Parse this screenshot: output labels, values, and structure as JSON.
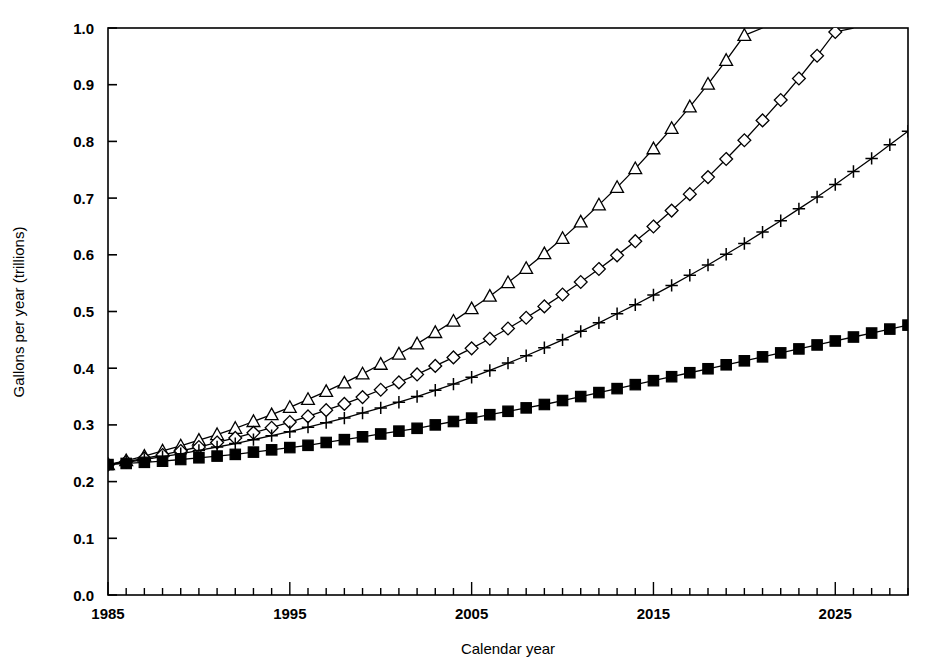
{
  "chart_data": {
    "type": "line",
    "title": "",
    "subtitle": "",
    "xlabel": "Calendar year",
    "ylabel": "Gallons per year (trillions)",
    "xlim": [
      1985,
      2029
    ],
    "ylim": [
      0.0,
      1.0
    ],
    "grid": false,
    "legend": "none",
    "xticks": [
      1985,
      1995,
      2005,
      2015,
      2025
    ],
    "xticklabels": [
      "1985",
      "1995",
      "2005",
      "2015",
      "2025"
    ],
    "xminor_step": 1,
    "yticks": [
      0.0,
      0.1,
      0.2,
      0.3,
      0.4,
      0.5,
      0.6,
      0.7,
      0.8,
      0.9,
      1.0
    ],
    "yticklabels": [
      "0.0",
      "0.1",
      "0.2",
      "0.3",
      "0.4",
      "0.5",
      "0.6",
      "0.7",
      "0.8",
      "0.9",
      "1.0"
    ],
    "x": [
      1985,
      1986,
      1987,
      1988,
      1989,
      1990,
      1991,
      1992,
      1993,
      1994,
      1995,
      1996,
      1997,
      1998,
      1999,
      2000,
      2001,
      2002,
      2003,
      2004,
      2005,
      2006,
      2007,
      2008,
      2009,
      2010,
      2011,
      2012,
      2013,
      2014,
      2015,
      2016,
      2017,
      2018,
      2019,
      2020,
      2021,
      2022,
      2023,
      2024,
      2025,
      2026,
      2027,
      2028,
      2029
    ],
    "series": [
      {
        "name": "triangle-series",
        "marker": "triangle-up-open",
        "values": [
          0.23,
          0.237,
          0.245,
          0.254,
          0.263,
          0.273,
          0.283,
          0.294,
          0.306,
          0.318,
          0.331,
          0.345,
          0.359,
          0.374,
          0.39,
          0.407,
          0.425,
          0.443,
          0.463,
          0.483,
          0.505,
          0.527,
          0.551,
          0.576,
          0.602,
          0.629,
          0.658,
          0.688,
          0.719,
          0.752,
          0.787,
          0.823,
          0.861,
          0.901,
          0.943,
          0.987,
          1.0,
          1.0,
          1.0,
          1.0,
          1.0,
          1.0,
          1.0,
          1.0,
          1.0
        ]
      },
      {
        "name": "diamond-series",
        "marker": "diamond-open",
        "values": [
          0.23,
          0.235,
          0.241,
          0.247,
          0.254,
          0.261,
          0.269,
          0.277,
          0.286,
          0.295,
          0.305,
          0.315,
          0.326,
          0.337,
          0.349,
          0.362,
          0.375,
          0.389,
          0.404,
          0.419,
          0.435,
          0.452,
          0.47,
          0.489,
          0.509,
          0.53,
          0.552,
          0.575,
          0.599,
          0.624,
          0.65,
          0.678,
          0.707,
          0.737,
          0.769,
          0.802,
          0.837,
          0.873,
          0.911,
          0.951,
          0.993,
          1.0,
          1.0,
          1.0,
          1.0
        ]
      },
      {
        "name": "plus-series",
        "marker": "plus",
        "values": [
          0.23,
          0.234,
          0.239,
          0.244,
          0.249,
          0.255,
          0.261,
          0.267,
          0.274,
          0.281,
          0.288,
          0.296,
          0.304,
          0.312,
          0.321,
          0.33,
          0.34,
          0.35,
          0.361,
          0.372,
          0.384,
          0.396,
          0.409,
          0.422,
          0.436,
          0.45,
          0.465,
          0.48,
          0.496,
          0.512,
          0.529,
          0.546,
          0.564,
          0.582,
          0.601,
          0.62,
          0.64,
          0.66,
          0.681,
          0.702,
          0.724,
          0.747,
          0.77,
          0.794,
          0.818
        ]
      },
      {
        "name": "square-series",
        "marker": "square-filled",
        "values": [
          0.23,
          0.232,
          0.234,
          0.236,
          0.239,
          0.242,
          0.245,
          0.248,
          0.252,
          0.256,
          0.26,
          0.264,
          0.269,
          0.274,
          0.279,
          0.284,
          0.289,
          0.294,
          0.3,
          0.306,
          0.312,
          0.318,
          0.324,
          0.33,
          0.336,
          0.343,
          0.35,
          0.357,
          0.364,
          0.371,
          0.378,
          0.385,
          0.392,
          0.399,
          0.406,
          0.413,
          0.42,
          0.427,
          0.434,
          0.441,
          0.448,
          0.455,
          0.462,
          0.469,
          0.476
        ]
      }
    ],
    "colors": {
      "line": "#000000",
      "background": "#ffffff",
      "axis": "#000000"
    }
  }
}
